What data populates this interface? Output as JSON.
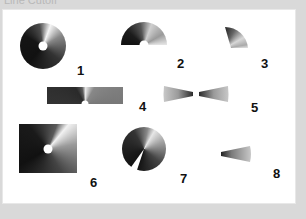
{
  "caption": "Line Cutoff",
  "figure": {
    "background_color": "#d9d9d9",
    "panel_color": "#ffffff",
    "items": [
      {
        "id": 1,
        "label": "1",
        "shape": "full-circle-with-center-hole"
      },
      {
        "id": 2,
        "label": "2",
        "shape": "half-circle-with-center-notch"
      },
      {
        "id": 3,
        "label": "3",
        "shape": "quarter-circle-wedge"
      },
      {
        "id": 4,
        "label": "4",
        "shape": "rectangle-with-center-notch"
      },
      {
        "id": 5,
        "label": "5",
        "shape": "opposed-wedges-bowtie"
      },
      {
        "id": 6,
        "label": "6",
        "shape": "square-with-center-hole"
      },
      {
        "id": 7,
        "label": "7",
        "shape": "circle-with-missing-slice"
      },
      {
        "id": 8,
        "label": "8",
        "shape": "narrow-wedge"
      }
    ],
    "gradient": {
      "type": "conic",
      "dark": "#111111",
      "mid": "#777777",
      "light": "#f2f2f2"
    }
  }
}
